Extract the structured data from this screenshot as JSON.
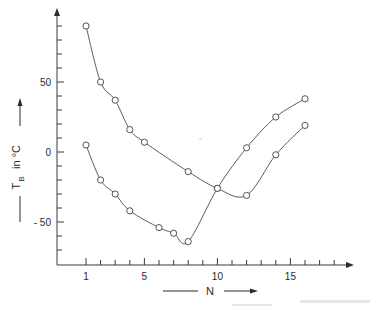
{
  "chart_data": {
    "type": "line",
    "title": "",
    "subtitle": "",
    "xlabel": "N",
    "ylabel": "T_B in °C",
    "ylabel_symbol": "T",
    "ylabel_subscript": "B",
    "ylabel_rest": " in °C",
    "xlim": [
      0,
      19
    ],
    "ylim": [
      -80,
      100
    ],
    "grid": false,
    "legend_position": "none",
    "x_ticks_major": [
      1,
      5,
      10,
      15
    ],
    "x_tick_labels": [
      "1",
      "5",
      "10",
      "15"
    ],
    "x_ticks_minor": [
      2,
      3,
      4,
      6,
      7,
      8,
      9,
      11,
      12,
      13,
      14,
      16,
      17,
      18
    ],
    "y_ticks_major": [
      50,
      0,
      -50
    ],
    "y_tick_labels": [
      "50",
      "0",
      "- 50"
    ],
    "y_ticks_minor": [
      90,
      80,
      70,
      60,
      40,
      30,
      20,
      10,
      -10,
      -20,
      -30,
      -40,
      -60,
      -70
    ],
    "marker": "open-circle",
    "series": [
      {
        "name": "upper-branch",
        "x": [
          1,
          2,
          3,
          4,
          5,
          8,
          10,
          12,
          14,
          16
        ],
        "values": [
          90,
          50,
          37,
          16,
          7,
          -14,
          -26,
          -31,
          -2,
          19
        ]
      },
      {
        "name": "lower-branch",
        "x": [
          1,
          2,
          3,
          4,
          6,
          7,
          8,
          10,
          12,
          14,
          16
        ],
        "values": [
          5,
          -20,
          -30,
          -42,
          -54,
          -58,
          -64,
          -26,
          3,
          25,
          38
        ]
      }
    ],
    "annotations": []
  },
  "axes": {
    "y_axis_name": "y-axis",
    "x_axis_name": "x-axis",
    "y_arrow_label": "arrow-up",
    "x_arrow_label": "arrow-right"
  },
  "labels": {
    "x_title": "N",
    "y_title_main": "T",
    "y_title_sub": "B",
    "y_title_tail": "in °C"
  }
}
